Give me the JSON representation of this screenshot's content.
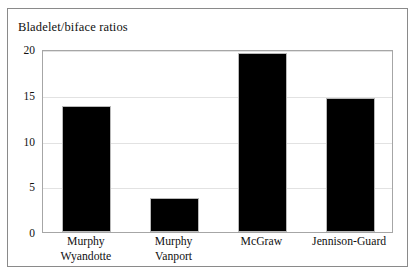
{
  "chart_data": {
    "type": "bar",
    "title": "Bladelet/biface ratios",
    "xlabel": "",
    "ylabel": "",
    "categories": [
      "Murphy Wyandotte",
      "Murphy Vanport",
      "McGraw",
      "Jennison-Guard"
    ],
    "category_lines": [
      [
        "Murphy",
        "Wyandotte"
      ],
      [
        "Murphy",
        "Vanport"
      ],
      [
        "McGraw"
      ],
      [
        "Jennison-Guard"
      ]
    ],
    "values": [
      13.8,
      3.7,
      19.6,
      14.7
    ],
    "ylim": [
      0,
      20
    ],
    "yticks": [
      0,
      5,
      10,
      15,
      20
    ],
    "ytick_labels": [
      "0",
      "5",
      "10",
      "15",
      "20"
    ],
    "grid": true,
    "legend": "none",
    "colors": {
      "bar_fill": "#000000",
      "bar_edge": "#b9b9b9",
      "gridline": "#e2e2e2",
      "axis": "#a6a6a6",
      "frame": "#8a8a8a",
      "text": "#111111",
      "background": "#ffffff"
    }
  }
}
